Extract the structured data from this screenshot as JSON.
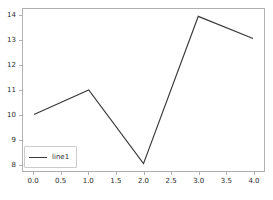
{
  "chart_data": {
    "type": "line",
    "title": "",
    "xlabel": "",
    "ylabel": "",
    "x": [
      0.0,
      1.0,
      2.0,
      3.0,
      4.0
    ],
    "series": [
      {
        "name": "line1",
        "values": [
          10.0,
          11.0,
          8.0,
          14.0,
          13.1
        ],
        "color": "#3a3a3a"
      }
    ],
    "xlim": [
      -0.2,
      4.2
    ],
    "ylim": [
      7.7,
      14.3
    ],
    "xticks": [
      0.0,
      0.5,
      1.0,
      1.5,
      2.0,
      2.5,
      3.0,
      3.5,
      4.0
    ],
    "xtick_labels": [
      "0.0",
      "0.5",
      "1.0",
      "1.5",
      "2.0",
      "2.5",
      "3.0",
      "3.5",
      "4.0"
    ],
    "yticks": [
      8,
      9,
      10,
      11,
      12,
      13,
      14
    ],
    "ytick_labels": [
      "8",
      "9",
      "10",
      "11",
      "12",
      "13",
      "14"
    ],
    "grid": false,
    "legend": {
      "position": "lower left",
      "entries": [
        "line1"
      ]
    },
    "colors": {
      "line": "#3a3a3a",
      "axes_edge": "#b0b0b0",
      "tick_text": "#2b2b2b",
      "background": "#ffffff"
    }
  }
}
